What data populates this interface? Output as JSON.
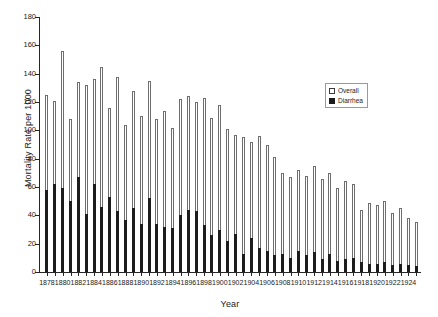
{
  "chart_data": {
    "type": "bar",
    "title": "",
    "xlabel": "Year",
    "ylabel": "Mortality Rate per 1000",
    "ylim": [
      0,
      180
    ],
    "ytick_values": [
      0,
      20,
      40,
      60,
      80,
      100,
      120,
      140,
      160,
      180
    ],
    "ytick_labels": [
      "0",
      "20",
      "40",
      "60",
      "80",
      "100",
      "120",
      "140",
      "160",
      "180"
    ],
    "grid": false,
    "legend_position": "upper right",
    "legend_entries": [
      "Overall",
      "Diarrhea"
    ],
    "xtick_labels": [
      "1878",
      "1880",
      "1882",
      "1884",
      "1886",
      "1888",
      "1890",
      "1892",
      "1894",
      "1896",
      "1898",
      "1900",
      "1902",
      "1904",
      "1906",
      "1908",
      "1910",
      "1912",
      "1914",
      "1916",
      "1918",
      "1920",
      "1922",
      "1924"
    ],
    "categories": [
      1878,
      1879,
      1880,
      1881,
      1882,
      1883,
      1884,
      1885,
      1886,
      1887,
      1888,
      1889,
      1890,
      1891,
      1892,
      1893,
      1894,
      1895,
      1896,
      1897,
      1898,
      1899,
      1900,
      1901,
      1902,
      1903,
      1904,
      1905,
      1906,
      1907,
      1908,
      1909,
      1910,
      1911,
      1912,
      1913,
      1914,
      1915,
      1916,
      1917,
      1918,
      1919,
      1920,
      1921,
      1922,
      1923,
      1924,
      1925
    ],
    "series": [
      {
        "name": "Overall",
        "color": "#ffffff",
        "edge_color": "#6e6e6e",
        "values": [
          125,
          121,
          156,
          108,
          134,
          132,
          136,
          145,
          116,
          138,
          104,
          128,
          110,
          135,
          108,
          114,
          102,
          122,
          124,
          120,
          123,
          109,
          118,
          101,
          97,
          95,
          92,
          96,
          90,
          81,
          70,
          67,
          72,
          68,
          75,
          66,
          70,
          59,
          64,
          62,
          44,
          49,
          47,
          50,
          42,
          45,
          38,
          35
        ]
      },
      {
        "name": "Diarrhea",
        "color": "#1c1c1c",
        "edge_color": "#1c1c1c",
        "values": [
          58,
          62,
          59,
          50,
          67,
          41,
          62,
          46,
          53,
          43,
          37,
          45,
          34,
          52,
          34,
          32,
          31,
          40,
          44,
          43,
          33,
          26,
          30,
          22,
          27,
          13,
          24,
          17,
          15,
          12,
          13,
          10,
          15,
          12,
          14,
          9,
          13,
          8,
          9,
          10,
          7,
          6,
          6,
          7,
          5,
          6,
          5,
          4
        ]
      }
    ]
  }
}
